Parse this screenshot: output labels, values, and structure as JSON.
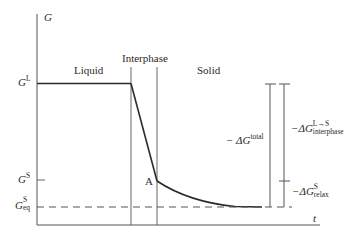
{
  "diagram": {
    "axes": {
      "y_label": "G",
      "x_label": "t"
    },
    "regions": [
      {
        "label": "Liquid"
      },
      {
        "label": "Interphase"
      },
      {
        "label": "Solid"
      }
    ],
    "levels": {
      "liquid": {
        "symbol": "G",
        "sup": "L"
      },
      "solid": {
        "symbol": "G",
        "sup": "S"
      },
      "equilibrium": {
        "symbol": "G",
        "sup": "S",
        "sub": "eq"
      }
    },
    "point_label": "A",
    "brackets": {
      "total": {
        "prefix": "− ΔG",
        "sup": "total"
      },
      "interphase": {
        "prefix": "−ΔG",
        "sup": "L→S",
        "sub": "interphase"
      },
      "relax": {
        "prefix": "−ΔG",
        "sup": "S",
        "sub": "relax"
      }
    },
    "colors": {
      "line": "#2a2a2a",
      "axis": "#4a4a4a",
      "background": "#ffffff"
    }
  }
}
